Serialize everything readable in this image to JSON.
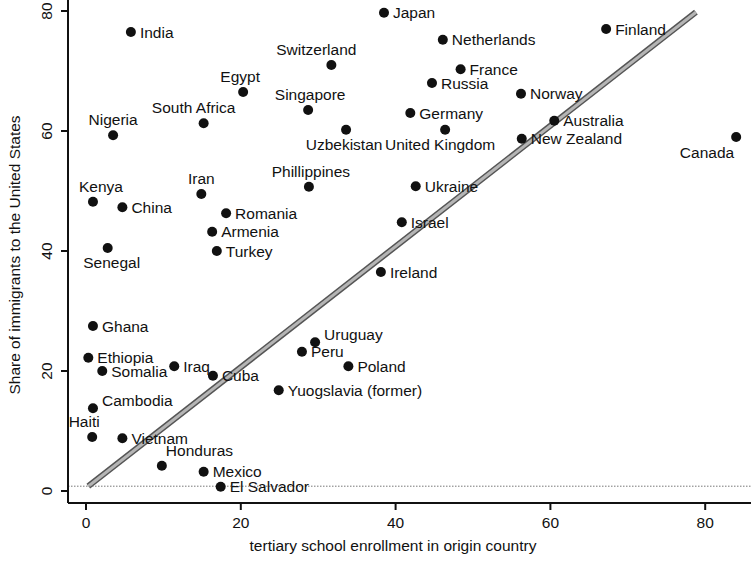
{
  "chart_data": {
    "type": "scatter",
    "title": "",
    "xlabel": "tertiary school enrollment in origin country",
    "ylabel": "Share of immigrants to the United States",
    "xlim": [
      -1,
      85
    ],
    "ylim": [
      -3,
      82
    ],
    "xticks": [
      0,
      20,
      40,
      60,
      80
    ],
    "yticks": [
      0,
      20,
      40,
      60,
      80
    ],
    "grid": false,
    "legend": null,
    "reference_lines": [
      {
        "kind": "diagonal",
        "label": "45-degree line (y = x)",
        "from": [
          0.3,
          0.8
        ],
        "to": [
          78.8,
          79.8
        ],
        "color": "#8a8a8a"
      },
      {
        "kind": "horizontal",
        "label": "y = 0 dotted baseline",
        "y": 0.8,
        "color": "#777777"
      }
    ],
    "points": [
      {
        "label": "India",
        "x": 5.8,
        "y": 76.5,
        "pos": "right"
      },
      {
        "label": "Japan",
        "x": 38.5,
        "y": 79.7,
        "pos": "right"
      },
      {
        "label": "Netherlands",
        "x": 46.1,
        "y": 75.2,
        "pos": "right"
      },
      {
        "label": "Finland",
        "x": 67.2,
        "y": 77.0,
        "pos": "right"
      },
      {
        "label": "Switzerland",
        "x": 31.7,
        "y": 71.0,
        "pos": "above"
      },
      {
        "label": "Egypt",
        "x": 20.3,
        "y": 66.5,
        "pos": "above"
      },
      {
        "label": "France",
        "x": 48.4,
        "y": 70.3,
        "pos": "right"
      },
      {
        "label": "Russia",
        "x": 44.7,
        "y": 68.0,
        "pos": "right"
      },
      {
        "label": "Norway",
        "x": 56.2,
        "y": 66.2,
        "pos": "right"
      },
      {
        "label": "Singapore",
        "x": 28.7,
        "y": 63.5,
        "pos": "above"
      },
      {
        "label": "South Africa",
        "x": 15.2,
        "y": 61.3,
        "pos": "above"
      },
      {
        "label": "Germany",
        "x": 41.9,
        "y": 63.0,
        "pos": "right"
      },
      {
        "label": "Australia",
        "x": 60.5,
        "y": 61.7,
        "pos": "right"
      },
      {
        "label": "Nigeria",
        "x": 3.5,
        "y": 59.3,
        "pos": "above"
      },
      {
        "label": "Uzbekistan",
        "x": 33.6,
        "y": 60.2,
        "pos": "below"
      },
      {
        "label": "United Kingdom",
        "x": 46.4,
        "y": 60.2,
        "pos": "below"
      },
      {
        "label": "New Zealand",
        "x": 56.3,
        "y": 58.7,
        "pos": "right"
      },
      {
        "label": "Canada",
        "x": 84.0,
        "y": 59.0,
        "pos": "below-left"
      },
      {
        "label": "Phillippines",
        "x": 28.8,
        "y": 50.7,
        "pos": "above"
      },
      {
        "label": "Ukraine",
        "x": 42.6,
        "y": 50.8,
        "pos": "right"
      },
      {
        "label": "Kenya",
        "x": 0.9,
        "y": 48.2,
        "pos": "above"
      },
      {
        "label": "China",
        "x": 4.7,
        "y": 47.3,
        "pos": "right"
      },
      {
        "label": "Iran",
        "x": 14.9,
        "y": 49.5,
        "pos": "above"
      },
      {
        "label": "Romania",
        "x": 18.1,
        "y": 46.3,
        "pos": "right"
      },
      {
        "label": "Israel",
        "x": 40.8,
        "y": 44.8,
        "pos": "right"
      },
      {
        "label": "Armenia",
        "x": 16.3,
        "y": 43.2,
        "pos": "right"
      },
      {
        "label": "Turkey",
        "x": 16.9,
        "y": 40.0,
        "pos": "right"
      },
      {
        "label": "Senegal",
        "x": 2.8,
        "y": 40.5,
        "pos": "below"
      },
      {
        "label": "Ireland",
        "x": 38.1,
        "y": 36.5,
        "pos": "right"
      },
      {
        "label": "Ghana",
        "x": 0.9,
        "y": 27.5,
        "pos": "right"
      },
      {
        "label": "Uruguay",
        "x": 29.6,
        "y": 24.8,
        "pos": "right-up"
      },
      {
        "label": "Peru",
        "x": 27.9,
        "y": 23.2,
        "pos": "right"
      },
      {
        "label": "Ethiopia",
        "x": 0.3,
        "y": 22.2,
        "pos": "right"
      },
      {
        "label": "Iraq",
        "x": 11.4,
        "y": 20.8,
        "pos": "right"
      },
      {
        "label": "Poland",
        "x": 33.9,
        "y": 20.8,
        "pos": "right"
      },
      {
        "label": "Somalia",
        "x": 2.1,
        "y": 20.0,
        "pos": "right"
      },
      {
        "label": "Cuba",
        "x": 16.4,
        "y": 19.2,
        "pos": "right"
      },
      {
        "label": "Yuogslavia (former)",
        "x": 24.9,
        "y": 16.8,
        "pos": "right"
      },
      {
        "label": "Cambodia",
        "x": 0.9,
        "y": 13.8,
        "pos": "right-up"
      },
      {
        "label": "Haiti",
        "x": 0.8,
        "y": 9.0,
        "pos": "above"
      },
      {
        "label": "Vietnam",
        "x": 4.7,
        "y": 8.8,
        "pos": "right"
      },
      {
        "label": "Honduras",
        "x": 9.8,
        "y": 4.2,
        "pos": "above-right"
      },
      {
        "label": "Mexico",
        "x": 15.2,
        "y": 3.2,
        "pos": "right"
      },
      {
        "label": "El Salvador",
        "x": 17.4,
        "y": 0.7,
        "pos": "right"
      }
    ]
  },
  "layout": {
    "x0_px": 86,
    "x_scale": 7.74,
    "y0_px": 491,
    "y_scale": 6.0,
    "axis_left_px": 68,
    "axis_bottom_px": 503,
    "plot_right_px": 751,
    "plot_top_px": 0
  },
  "colors": {
    "dot": "#111111",
    "diagonal": "#8a8a8a",
    "baseline": "#777777",
    "axis": "#111111",
    "text": "#111111"
  }
}
